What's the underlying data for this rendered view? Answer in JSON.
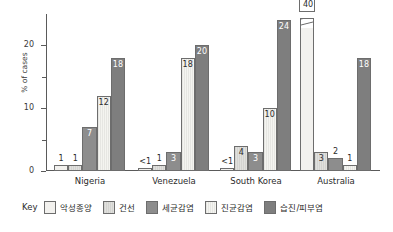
{
  "chart_data": {
    "type": "bar",
    "title": "",
    "subtitle": "",
    "xlabel": "",
    "ylabel": "% of cases",
    "ylim": [
      0,
      25
    ],
    "yticks": [
      0,
      10,
      20
    ],
    "yticks_minor": [
      5,
      15
    ],
    "grid": false,
    "legend_position": "bottom",
    "legend_title": "Key",
    "categories": [
      "Nigeria",
      "Venezuela",
      "South Korea",
      "Australia"
    ],
    "series": [
      {
        "name": "악성종양",
        "color": "#f2f1ee",
        "values": [
          1,
          0.5,
          0.5,
          40
        ],
        "labels": [
          "1",
          "<1",
          "<1",
          "40"
        ],
        "broken_axis": [
          false,
          false,
          false,
          true
        ]
      },
      {
        "name": "건선",
        "color": "#d9d9d6",
        "values": [
          1,
          1,
          4,
          3
        ],
        "labels": [
          "1",
          "1",
          "4",
          "3"
        ],
        "broken_axis": [
          false,
          false,
          false,
          false
        ]
      },
      {
        "name": "세균감염",
        "color": "#8d8d8d",
        "values": [
          7,
          3,
          3,
          2
        ],
        "labels": [
          "7",
          "3",
          "3",
          "2"
        ],
        "broken_axis": [
          false,
          false,
          false,
          false
        ]
      },
      {
        "name": "진균감염",
        "color": "#eeeeea",
        "values": [
          12,
          18,
          10,
          1
        ],
        "labels": [
          "12",
          "18",
          "10",
          "1"
        ],
        "broken_axis": [
          false,
          false,
          false,
          false
        ]
      },
      {
        "name": "습진/피부염",
        "color": "#7e7e7e",
        "values": [
          18,
          20,
          24,
          18
        ],
        "labels": [
          "18",
          "20",
          "24",
          "18"
        ],
        "broken_axis": [
          false,
          false,
          false,
          false
        ]
      }
    ]
  },
  "axis": {
    "ytick_labels": [
      "0",
      "10",
      "20"
    ],
    "ylabel": "% of cases"
  },
  "legend": {
    "title": "Key",
    "items": [
      {
        "label": "악성종양",
        "color": "#f2f1ee"
      },
      {
        "label": "건선",
        "color": "#d9d9d6"
      },
      {
        "label": "세균감염",
        "color": "#8d8d8d"
      },
      {
        "label": "진균감염",
        "color": "#eeeeea"
      },
      {
        "label": "습진/피부염",
        "color": "#7e7e7e"
      }
    ]
  }
}
